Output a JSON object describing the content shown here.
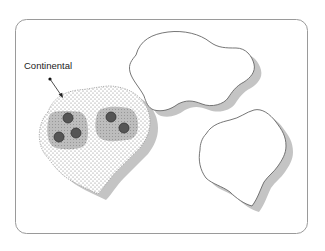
{
  "diagram": {
    "labels": {
      "continental": "Continental"
    },
    "colors": {
      "frame_stroke": "#9a9a9a",
      "outline": "#555555",
      "shadow": "#c4c4c4",
      "stipple_dot": "#777777",
      "cluster_fill": "#b8b8b8",
      "node_fill": "#555555",
      "node_stroke": "#333333"
    },
    "regions": [
      {
        "id": "continental",
        "fill": "stippled",
        "clusters": [
          {
            "nodes": 3
          },
          {
            "nodes": 2
          }
        ]
      },
      {
        "id": "region-top-right",
        "fill": "blank",
        "clusters": []
      },
      {
        "id": "region-bottom-right",
        "fill": "blank",
        "clusters": []
      }
    ]
  }
}
